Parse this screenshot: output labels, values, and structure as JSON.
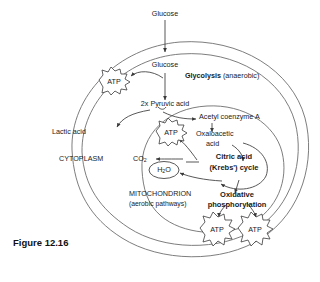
{
  "figure": {
    "caption": "Figure 12.16"
  },
  "compartments": {
    "cytoplasm": "CYTOPLASM",
    "mitochondrion": "MITOCHONDRION",
    "mitochondrion_sub": "(aerobic pathways)"
  },
  "labels": {
    "glucose_outside": "Glucose",
    "glucose_inside": "Glucose",
    "glycolysis_bold": "Glycolysis",
    "glycolysis_note": "(anaerobic)",
    "pyruvic": "2x Pyruvic acid",
    "lactic": "Lactic acid",
    "acetyl": "Acetyl coenzyme A",
    "oxaloacetic_l1": "Oxaloacetic",
    "oxaloacetic_l2": "acid",
    "krebs_l1": "Citric acid",
    "krebs_l2": "(Krebs') cycle",
    "co2": "CO",
    "co2_sub": "2",
    "h2o_h": "H",
    "h2o_sub": "2",
    "h2o_o": "O",
    "oxphos_l1": "Oxidative",
    "oxphos_l2": "phosphorylation",
    "atp": "ATP"
  },
  "atp_nodes": [
    {
      "name": "atp-glycolysis",
      "label": "ATP"
    },
    {
      "name": "atp-krebs",
      "label": "ATP"
    },
    {
      "name": "atp-oxphos-left",
      "label": "ATP"
    },
    {
      "name": "atp-oxphos-right",
      "label": "ATP"
    }
  ],
  "colors": {
    "stroke": "#3a3a3a",
    "text": "#1a1a1a",
    "background": "#ffffff"
  }
}
